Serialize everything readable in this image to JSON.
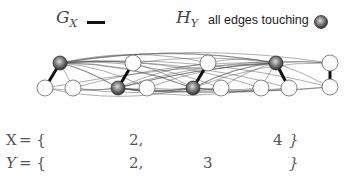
{
  "legend": {
    "g_label": "G",
    "g_sub": "X",
    "h_label": "H",
    "h_sub": "Y",
    "h_text": "all edges touching"
  },
  "colors": {
    "thick_edge": "#111111",
    "thin_edge": "#555555",
    "white_node_fill": "#ffffff",
    "node_stroke": "#666666",
    "gray_node": "#6a6a6a"
  },
  "graph": {
    "nodes": [
      {
        "id": "a1",
        "x": 60,
        "y": 63,
        "type": "gray"
      },
      {
        "id": "a2",
        "x": 45,
        "y": 88,
        "type": "white"
      },
      {
        "id": "b1",
        "x": 73,
        "y": 88,
        "type": "white"
      },
      {
        "id": "c1",
        "x": 133,
        "y": 63,
        "type": "white"
      },
      {
        "id": "c2",
        "x": 147,
        "y": 88,
        "type": "white"
      },
      {
        "id": "d1",
        "x": 118,
        "y": 88,
        "type": "gray"
      },
      {
        "id": "e1",
        "x": 208,
        "y": 63,
        "type": "white"
      },
      {
        "id": "e2",
        "x": 193,
        "y": 88,
        "type": "gray"
      },
      {
        "id": "f1",
        "x": 221,
        "y": 88,
        "type": "white"
      },
      {
        "id": "g1",
        "x": 261,
        "y": 88,
        "type": "white"
      },
      {
        "id": "h1",
        "x": 276,
        "y": 63,
        "type": "gray"
      },
      {
        "id": "h2",
        "x": 289,
        "y": 88,
        "type": "white"
      },
      {
        "id": "i1",
        "x": 330,
        "y": 63,
        "type": "white"
      },
      {
        "id": "i2",
        "x": 330,
        "y": 87,
        "type": "white"
      }
    ],
    "thick_edges": [
      [
        "a1",
        "a2"
      ],
      [
        "c1",
        "d1"
      ],
      [
        "e1",
        "e2"
      ],
      [
        "h1",
        "h2"
      ],
      [
        "i1",
        "i2"
      ]
    ]
  },
  "sets": {
    "x_row": {
      "label": "X",
      "eq": "= {",
      "item1": "2,",
      "item2": "4",
      "close": "}"
    },
    "y_row": {
      "label": "Y",
      "eq": "= {",
      "item1": "2,",
      "item2": "3",
      "close": "}"
    }
  }
}
